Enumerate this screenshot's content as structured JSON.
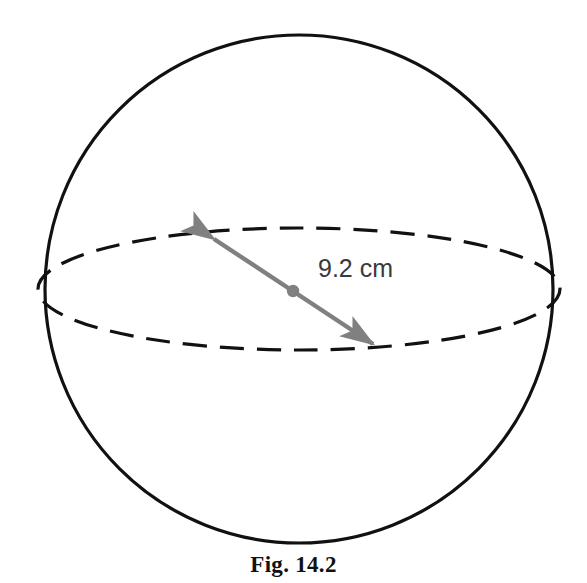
{
  "figure": {
    "caption": "Fig. 14.2",
    "dimension_label": "9.2 cm",
    "shape": "sphere",
    "equator": "dashed-ellipse",
    "center_marker": "dot",
    "measurement_line": "double-headed-arrow-diameter",
    "colors": {
      "outline": "#111111",
      "equator": "#111111",
      "arrow": "#808080",
      "center_dot": "#808080",
      "label_text": "#3a3a3a",
      "caption_text": "#111111",
      "background": "#ffffff"
    },
    "geometry": {
      "circle_center_x": 299,
      "circle_center_y": 289,
      "circle_radius": 254,
      "ellipse_rx": 261,
      "ellipse_ry": 61,
      "arrow_start_x": 208,
      "arrow_start_y": 234,
      "arrow_end_x": 379,
      "arrow_end_y": 349,
      "dot_x": 293,
      "dot_y": 291
    }
  }
}
